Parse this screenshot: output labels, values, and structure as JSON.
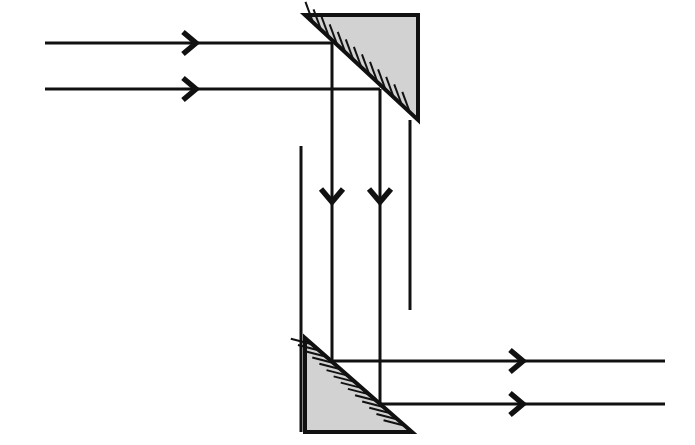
{
  "canvas": {
    "width": 695,
    "height": 445,
    "background": "#ffffff"
  },
  "style": {
    "stroke_color": "#111111",
    "prism_fill": "#d2d2d2",
    "prism_edge_color": "#111111",
    "hatch_color": "#111111",
    "ray_width": 3,
    "prism_edge_width": 4,
    "hatch_width": 2
  },
  "diagram": {
    "type": "optical-ray-diagram",
    "prisms": [
      {
        "name": "upper-prism",
        "orientation": "hypotenuse-top-left-to-bottom-right",
        "fill": "#d2d2d2",
        "vertices": [
          [
            305,
            15
          ],
          [
            418,
            15
          ],
          [
            418,
            120
          ]
        ],
        "hypotenuse": [
          [
            305,
            15
          ],
          [
            418,
            120
          ]
        ],
        "hatch_side": "below-left",
        "hatch_count": 13
      },
      {
        "name": "lower-prism",
        "orientation": "hypotenuse-top-left-to-bottom-right",
        "fill": "#d2d2d2",
        "vertices": [
          [
            305,
            338
          ],
          [
            305,
            432
          ],
          [
            412,
            432
          ]
        ],
        "hypotenuse": [
          [
            305,
            338
          ],
          [
            412,
            432
          ]
        ],
        "hatch_side": "below-left",
        "hatch_count": 14
      }
    ],
    "rays": [
      {
        "name": "incoming-ray-upper",
        "direction": "right",
        "from": [
          45,
          43
        ],
        "to": [
          332,
          43
        ],
        "arrowheads": [
          {
            "x": 196,
            "y": 43,
            "dir": "right"
          }
        ]
      },
      {
        "name": "incoming-ray-lower",
        "direction": "right",
        "from": [
          45,
          89
        ],
        "to": [
          380,
          89
        ],
        "arrowheads": [
          {
            "x": 196,
            "y": 89,
            "dir": "right"
          }
        ]
      },
      {
        "name": "vertical-ray-left",
        "direction": "down",
        "from": [
          332,
          43
        ],
        "to": [
          332,
          362
        ],
        "arrowheads": [
          {
            "x": 332,
            "y": 202,
            "dir": "down"
          }
        ]
      },
      {
        "name": "vertical-ray-right",
        "direction": "down",
        "from": [
          380,
          89
        ],
        "to": [
          380,
          404
        ],
        "arrowheads": [
          {
            "x": 380,
            "y": 202,
            "dir": "down"
          }
        ]
      },
      {
        "name": "aperture-edge-left",
        "direction": "down",
        "from": [
          301,
          146
        ],
        "to": [
          301,
          432
        ],
        "arrowheads": []
      },
      {
        "name": "aperture-edge-right",
        "direction": "down",
        "from": [
          410,
          120
        ],
        "to": [
          410,
          310
        ],
        "arrowheads": []
      },
      {
        "name": "outgoing-ray-upper",
        "direction": "right",
        "from": [
          332,
          361
        ],
        "to": [
          665,
          361
        ],
        "arrowheads": [
          {
            "x": 523,
            "y": 361,
            "dir": "right"
          }
        ]
      },
      {
        "name": "outgoing-ray-lower",
        "direction": "right",
        "from": [
          380,
          404
        ],
        "to": [
          665,
          404
        ],
        "arrowheads": [
          {
            "x": 523,
            "y": 404,
            "dir": "right"
          }
        ]
      }
    ]
  }
}
